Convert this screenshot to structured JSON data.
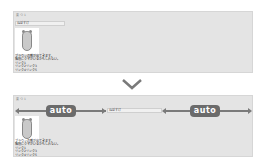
{
  "before": {
    "label": "要 つ 1",
    "input_value": "ねぼすけ",
    "image_alt": "bear",
    "text_lines": [
      "ブラウンの熊が出てきます。",
      "階段にクマがいるかもしれない。",
      "リンク1",
      "リンク2リンク3",
      "リンク4リンク5"
    ]
  },
  "after": {
    "label": "要 つ 1",
    "input_value": "ねぼすけ",
    "image_alt": "bear",
    "margin_left_label": "auto",
    "margin_right_label": "auto",
    "text_lines": [
      "ブラウンの熊が出てきます。",
      "階段にクマがいるかもしれない。",
      "リンク1",
      "リンク2リンク3",
      "リンク4リンク5"
    ]
  },
  "transition_icon": "chevron-down-icon",
  "colors": {
    "panel": "#e4e4e4",
    "arrow": "#7a7a7a",
    "pill": "#6b6b6b"
  }
}
